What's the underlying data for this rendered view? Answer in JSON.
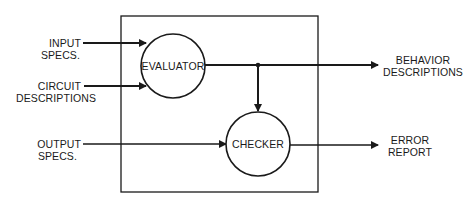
{
  "diagram": {
    "type": "block-flow",
    "colors": {
      "stroke": "#1a1a1a",
      "background": "#ffffff"
    },
    "nodes": [
      {
        "id": "evaluator",
        "label": "EVALUATOR",
        "shape": "circle"
      },
      {
        "id": "checker",
        "label": "CHECKER",
        "shape": "circle"
      }
    ],
    "inputs": [
      {
        "id": "input-specs",
        "line1": "INPUT",
        "line2": "SPECS.",
        "target": "evaluator"
      },
      {
        "id": "circuit-descriptions",
        "line1": "CIRCUIT",
        "line2": "DESCRIPTIONS",
        "target": "evaluator"
      },
      {
        "id": "output-specs",
        "line1": "OUTPUT",
        "line2": "SPECS.",
        "target": "checker"
      }
    ],
    "outputs": [
      {
        "id": "behavior-descriptions",
        "line1": "BEHAVIOR",
        "line2": "DESCRIPTIONS",
        "source": "evaluator"
      },
      {
        "id": "error-report",
        "line1": "ERROR",
        "line2": "REPORT",
        "source": "checker"
      }
    ],
    "edges": [
      {
        "from": "input-specs",
        "to": "evaluator"
      },
      {
        "from": "circuit-descriptions",
        "to": "evaluator"
      },
      {
        "from": "evaluator",
        "to": "behavior-descriptions"
      },
      {
        "from": "evaluator",
        "to": "checker"
      },
      {
        "from": "output-specs",
        "to": "checker"
      },
      {
        "from": "checker",
        "to": "error-report"
      }
    ]
  }
}
